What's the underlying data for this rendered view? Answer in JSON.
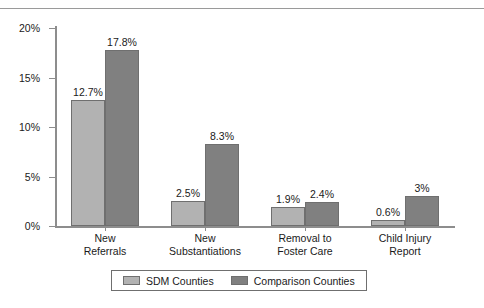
{
  "chart_data": {
    "type": "bar",
    "title": "",
    "xlabel": "",
    "ylabel": "",
    "ylim": [
      0,
      20
    ],
    "grid": false,
    "legend_position": "bottom",
    "ytick_labels": [
      "0%",
      "5%",
      "10%",
      "15%",
      "20%"
    ],
    "ytick_values": [
      0,
      5,
      10,
      15,
      20
    ],
    "categories": [
      "New\nReferrals",
      "New\nSubstantiations",
      "Removal to\nFoster Care",
      "Child Injury\nReport"
    ],
    "category_lines": [
      [
        "New",
        "Referrals"
      ],
      [
        "New",
        "Substantiations"
      ],
      [
        "Removal to",
        "Foster Care"
      ],
      [
        "Child Injury",
        "Report"
      ]
    ],
    "series": [
      {
        "name": "SDM Counties",
        "color": "#b2b2b2",
        "values": [
          12.7,
          2.5,
          1.9,
          0.6
        ],
        "data_labels": [
          "12.7%",
          "2.5%",
          "1.9%",
          "0.6%"
        ]
      },
      {
        "name": "Comparison Counties",
        "color": "#808080",
        "values": [
          17.8,
          8.3,
          2.4,
          3.0
        ],
        "data_labels": [
          "17.8%",
          "8.3%",
          "2.4%",
          "3%"
        ]
      }
    ]
  },
  "legend": {
    "entries": [
      {
        "label": "SDM Counties",
        "color": "#b2b2b2"
      },
      {
        "label": "Comparison Counties",
        "color": "#808080"
      }
    ]
  },
  "colors": {
    "series_light": "#b2b2b2",
    "series_dark": "#808080",
    "axis": "#8d8d8d",
    "text": "#1a1a1a",
    "background": "#ffffff"
  }
}
